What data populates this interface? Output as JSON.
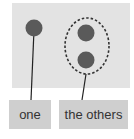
{
  "labels": {
    "one": "one",
    "others": "the others"
  },
  "colors": {
    "panel": "#e3e3e3",
    "dot": "#5a5a5a",
    "label_bg": "#cfcfcf",
    "line": "#222222"
  }
}
